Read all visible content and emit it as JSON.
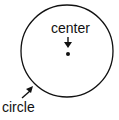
{
  "diagram": {
    "labels": {
      "center": "center",
      "circle": "circle"
    },
    "circle": {
      "cx": 67,
      "cy": 51,
      "r": 46,
      "stroke": "#111111"
    },
    "center_point": {
      "cx": 67,
      "cy": 54
    }
  }
}
